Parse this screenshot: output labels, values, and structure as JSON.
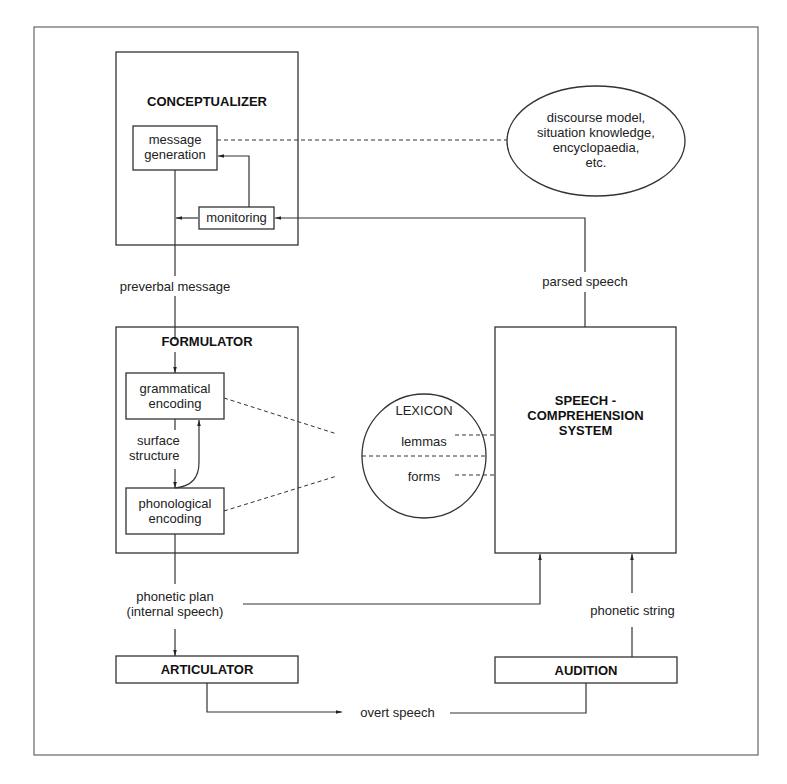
{
  "diagram": {
    "title": "",
    "conceptualizer": {
      "label": "CONCEPTUALIZER",
      "message_generation": {
        "line1": "message",
        "line2": "generation"
      },
      "monitoring": "monitoring"
    },
    "knowledge_store": {
      "line1": "discourse model,",
      "line2": "situation knowledge,",
      "line3": "encyclopaedia,",
      "line4": "etc."
    },
    "preverbal_message": "preverbal message",
    "parsed_speech": "parsed speech",
    "formulator": {
      "label": "FORMULATOR",
      "grammatical_encoding": {
        "line1": "grammatical",
        "line2": "encoding"
      },
      "surface_structure": {
        "line1": "surface",
        "line2": "structure"
      },
      "phonological_encoding": {
        "line1": "phonological",
        "line2": "encoding"
      }
    },
    "lexicon": {
      "label": "LEXICON",
      "top": "lemmas",
      "bottom": "forms"
    },
    "speech_comprehension": {
      "line1": "SPEECH -",
      "line2": "COMPREHENSION",
      "line3": "SYSTEM"
    },
    "phonetic_plan": {
      "line1": "phonetic plan",
      "line2": "(internal speech)"
    },
    "phonetic_string": "phonetic string",
    "articulator": "ARTICULATOR",
    "audition": "AUDITION",
    "overt_speech": "overt speech"
  },
  "colors": {
    "line": "#2a2a2a",
    "background": "#ffffff",
    "frame": "#555555"
  }
}
